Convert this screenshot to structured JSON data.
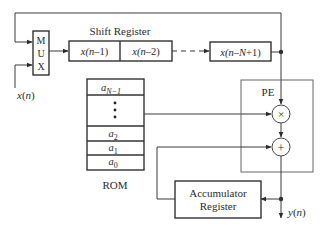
{
  "diagram": {
    "type": "block-diagram",
    "mux": {
      "letters": [
        "M",
        "U",
        "X"
      ]
    },
    "input": {
      "label_main": "x",
      "label_arg": "(n)"
    },
    "shift_register": {
      "title": "Shift Register",
      "cells": [
        {
          "pre": "x(",
          "var": "n",
          "post": "–1)"
        },
        {
          "pre": "x(",
          "var": "n",
          "post": "–2)"
        },
        {
          "pre": "x(",
          "var": "n–N",
          "post": "+1)"
        }
      ]
    },
    "rom": {
      "label": "ROM",
      "entries": [
        {
          "base": "a",
          "sub": "N−1"
        },
        {
          "base": "⋮",
          "sub": ""
        },
        {
          "base": "a",
          "sub": "2"
        },
        {
          "base": "a",
          "sub": "1"
        },
        {
          "base": "a",
          "sub": "0"
        }
      ]
    },
    "pe": {
      "label": "PE",
      "multiplier_symbol": "×",
      "adder_symbol": "+"
    },
    "accumulator": {
      "line1": "Accumulator",
      "line2": "Register"
    },
    "output": {
      "label_main": "y",
      "label_arg": "(n)"
    },
    "colors": {
      "line": "#3a3a3a",
      "box": "#333333",
      "pe_box": "#666666",
      "text": "#2b2b2b"
    }
  }
}
